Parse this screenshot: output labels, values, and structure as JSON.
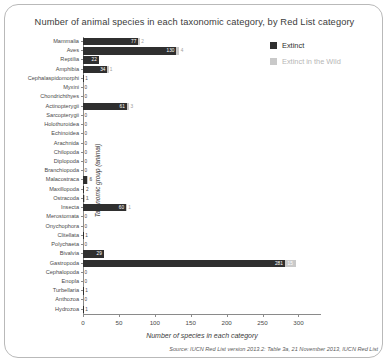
{
  "title": "Number of animal species in each taxonomic category, by Red List category",
  "legend": {
    "extinct_label": "Extinct",
    "extinct_wild_label": "Extinct in the Wild",
    "extinct_color": "#2f2f2f",
    "extinct_wild_color": "#c9c9c9"
  },
  "axis": {
    "x_title": "Number of species in each category",
    "y_title": "Taxonomic group (animal)",
    "x_ticks": [
      0,
      50,
      100,
      150,
      200,
      250,
      300
    ]
  },
  "source": "Source: IUCN Red List version 2013.2: Table 3a, 21 November 2013, IUCN Red List",
  "chart_data": {
    "type": "bar",
    "orientation": "horizontal",
    "title": "Number of animal species in each taxonomic category, by Red List category",
    "xlabel": "Number of species in each category",
    "ylabel": "Taxonomic group (animal)",
    "xlim": [
      0,
      330
    ],
    "grid": false,
    "legend_position": "top-right",
    "categories": [
      "Mammalia",
      "Aves",
      "Reptilia",
      "Amphibia",
      "Cephalaspidomorphi",
      "Myxini",
      "Chondrichthyes",
      "Actinopterygii",
      "Sarcopterygii",
      "Holothuroidea",
      "Echinoidea",
      "Arachnida",
      "Chilopoda",
      "Diplopoda",
      "Branchiopoda",
      "Malacostraca",
      "Maxillopoda",
      "Ostracoda",
      "Insecta",
      "Merostomata",
      "Onychophora",
      "Clitellata",
      "Polychaeta",
      "Bivalvia",
      "Gastropoda",
      "Cephalopoda",
      "Enopla",
      "Turbellaria",
      "Anthozoa",
      "Hydrozoa"
    ],
    "series": [
      {
        "name": "Extinct",
        "color": "#2f2f2f",
        "values": [
          77,
          130,
          22,
          34,
          1,
          0,
          0,
          61,
          0,
          0,
          0,
          0,
          0,
          0,
          0,
          6,
          2,
          1,
          60,
          0,
          0,
          1,
          0,
          29,
          281,
          0,
          0,
          1,
          0,
          1
        ]
      },
      {
        "name": "Extinct in the Wild",
        "color": "#c9c9c9",
        "values": [
          2,
          4,
          0,
          1,
          0,
          0,
          0,
          3,
          0,
          0,
          0,
          0,
          0,
          0,
          0,
          1,
          0,
          1,
          1,
          0,
          0,
          0,
          0,
          0,
          15,
          0,
          0,
          0,
          0,
          0
        ]
      }
    ]
  },
  "bars": [
    {
      "label": "Mammalia",
      "extinct": 77,
      "wild": 2
    },
    {
      "label": "Aves",
      "extinct": 130,
      "wild": 4
    },
    {
      "label": "Reptilia",
      "extinct": 22,
      "wild": 0
    },
    {
      "label": "Amphibia",
      "extinct": 34,
      "wild": 1
    },
    {
      "label": "Cephalaspidomorphi",
      "extinct": 1,
      "wild": 0
    },
    {
      "label": "Myxini",
      "extinct": 0,
      "wild": 0
    },
    {
      "label": "Chondrichthyes",
      "extinct": 0,
      "wild": 0
    },
    {
      "label": "Actinopterygii",
      "extinct": 61,
      "wild": 3
    },
    {
      "label": "Sarcopterygii",
      "extinct": 0,
      "wild": 0
    },
    {
      "label": "Holothuroidea",
      "extinct": 0,
      "wild": 0
    },
    {
      "label": "Echinoidea",
      "extinct": 0,
      "wild": 0
    },
    {
      "label": "Arachnida",
      "extinct": 0,
      "wild": 0
    },
    {
      "label": "Chilopoda",
      "extinct": 0,
      "wild": 0
    },
    {
      "label": "Diplopoda",
      "extinct": 0,
      "wild": 0
    },
    {
      "label": "Branchiopoda",
      "extinct": 0,
      "wild": 0
    },
    {
      "label": "Malacostraca",
      "extinct": 6,
      "wild": 1
    },
    {
      "label": "Maxillopoda",
      "extinct": 2,
      "wild": 0
    },
    {
      "label": "Ostracoda",
      "extinct": 1,
      "wild": 1
    },
    {
      "label": "Insecta",
      "extinct": 60,
      "wild": 1
    },
    {
      "label": "Merostomata",
      "extinct": 0,
      "wild": 0
    },
    {
      "label": "Onychophora",
      "extinct": 0,
      "wild": 0
    },
    {
      "label": "Clitellata",
      "extinct": 1,
      "wild": 0
    },
    {
      "label": "Polychaeta",
      "extinct": 0,
      "wild": 0
    },
    {
      "label": "Bivalvia",
      "extinct": 29,
      "wild": 0
    },
    {
      "label": "Gastropoda",
      "extinct": 281,
      "wild": 15
    },
    {
      "label": "Cephalopoda",
      "extinct": 0,
      "wild": 0
    },
    {
      "label": "Enopla",
      "extinct": 0,
      "wild": 0
    },
    {
      "label": "Turbellaria",
      "extinct": 1,
      "wild": 0
    },
    {
      "label": "Anthozoa",
      "extinct": 0,
      "wild": 0
    },
    {
      "label": "Hydrozoa",
      "extinct": 1,
      "wild": 0
    }
  ]
}
